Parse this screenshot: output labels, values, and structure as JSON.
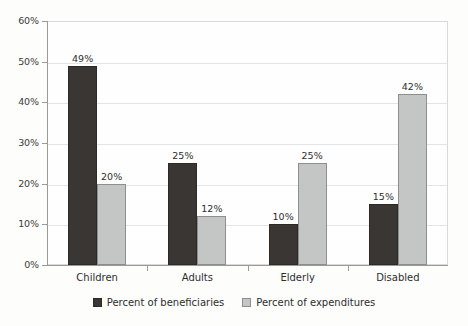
{
  "chart_data": {
    "type": "bar",
    "title": "",
    "subtitle": "",
    "xlabel": "",
    "ylabel": "",
    "categories": [
      "Children",
      "Adults",
      "Elderly",
      "Disabled"
    ],
    "series": [
      {
        "name": "Percent of beneficiaries",
        "color": "#3a3634",
        "values": [
          49,
          25,
          10,
          15
        ],
        "labels": [
          "49%",
          "25%",
          "10%",
          "15%"
        ]
      },
      {
        "name": "Percent of expenditures",
        "color": "#c4c6c5",
        "values": [
          20,
          12,
          25,
          42
        ],
        "labels": [
          "20%",
          "12%",
          "25%",
          "42%"
        ]
      }
    ],
    "ylim": [
      0,
      60
    ],
    "ytick_values": [
      0,
      10,
      20,
      30,
      40,
      50,
      60
    ],
    "ytick_labels": [
      "0%",
      "10%",
      "20%",
      "30%",
      "40%",
      "50%",
      "60%"
    ],
    "grid": true,
    "grid_axis": "y",
    "legend_position": "bottom-center",
    "value_labels_shown": true
  },
  "colors": {
    "background": "#fdfdfc",
    "plot_background": "#fefefe",
    "frame": "#d9d9d9",
    "gridline": "#e3e4e3",
    "axis": "#9a9a98",
    "text": "#2d2d2d",
    "series_beneficiaries": "#3a3634",
    "series_expenditures": "#c4c6c5"
  }
}
